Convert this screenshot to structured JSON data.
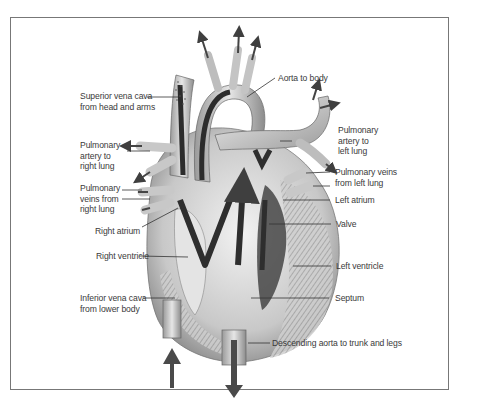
{
  "diagram": {
    "labels": {
      "aorta_to_body": "Aorta to body",
      "superior_vena_cava": "Superior vena cava\nfrom head and arms",
      "pulmonary_artery_left": "Pulmonary\nartery to\nleft lung",
      "pulmonary_artery_right": "Pulmonary\nartery to\nright lung",
      "pulmonary_veins_left": "Pulmonary veins\nfrom left lung",
      "pulmonary_veins_right": "Pulmonary\nveins from\nright lung",
      "left_atrium": "Left atrium",
      "valve": "Valve",
      "right_atrium": "Right atrium",
      "right_ventricle": "Right ventricle",
      "left_ventricle": "Left ventricle",
      "inferior_vena_cava": "Inferior vena cava\nfrom lower body",
      "septum": "Septum",
      "descending_aorta": "Descending aorta to trunk and legs"
    },
    "colors": {
      "frame": "#777777",
      "tissue_light": "#d9d9d9",
      "tissue_mid": "#a8a8a8",
      "tissue_dark": "#3c3c3c",
      "arrow": "#4a4a4a",
      "leader": "#333333"
    }
  }
}
